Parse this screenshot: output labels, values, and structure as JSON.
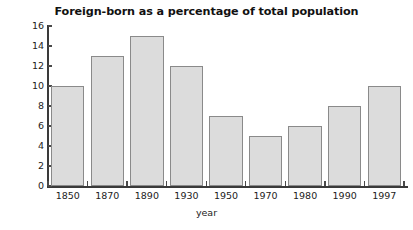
{
  "chart_data": {
    "type": "bar",
    "title": "Foreign-born as a percentage of total population",
    "xlabel": "year",
    "ylabel": "percentage",
    "categories": [
      "1850",
      "1870",
      "1890",
      "1930",
      "1950",
      "1970",
      "1980",
      "1990",
      "1997"
    ],
    "values": [
      10,
      13,
      15,
      12,
      7,
      5,
      6,
      8,
      10
    ],
    "ylim": [
      0,
      16
    ],
    "yticks": [
      0,
      2,
      4,
      6,
      8,
      10,
      12,
      14,
      16
    ],
    "ytick_labels": [
      "0",
      "2",
      "4",
      "6",
      "8",
      "10",
      "12",
      "14",
      "16"
    ],
    "grid": false,
    "legend": null,
    "bar_fill_color": "#dcdcdc",
    "bar_edge_color": "#8a8a8a",
    "axis_color": "#3a3a3a",
    "background_color": "#ffffff"
  }
}
